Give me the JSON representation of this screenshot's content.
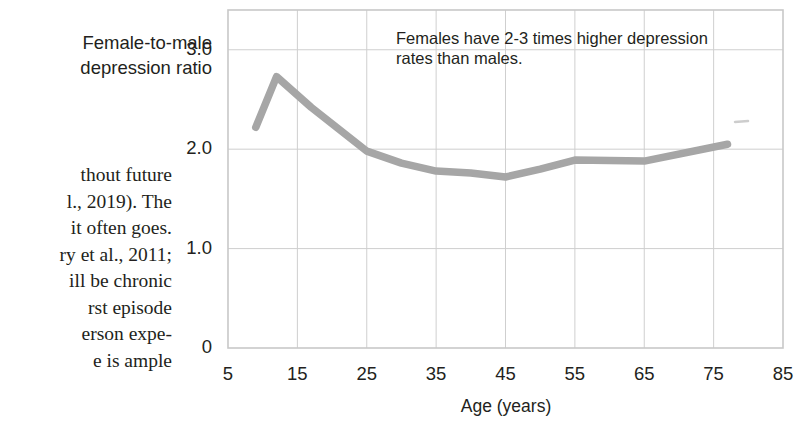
{
  "page": {
    "axis_title_lines": [
      "Female-to-male",
      "depression ratio"
    ],
    "body_text_lines": [
      "thout future",
      "l., 2019). The",
      "it often goes.",
      "ry et al., 2011;",
      "ill be chronic",
      "rst episode",
      "erson expe-",
      "e is ample"
    ]
  },
  "chart_data": {
    "type": "line",
    "title": "",
    "annotation": "Females have 2-3 times higher depression rates than males.",
    "annotation_lines": [
      "Females have 2-3 times higher depression",
      "rates than males."
    ],
    "xlabel": "Age (years)",
    "ylabel": "Female-to-male depression ratio",
    "xlim": [
      5,
      85
    ],
    "ylim": [
      0,
      3.4
    ],
    "xticks": [
      5,
      15,
      25,
      35,
      45,
      55,
      65,
      75,
      85
    ],
    "xtick_labels": [
      "5",
      "15",
      "25",
      "35",
      "45",
      "55",
      "65",
      "75",
      "85"
    ],
    "yticks": [
      0,
      1.0,
      2.0,
      3.0
    ],
    "ytick_labels": [
      "0",
      "1.0",
      "2.0",
      "3.0"
    ],
    "grid": true,
    "legend": "none",
    "line_color": "#a6a6a6",
    "grid_color": "#cfcfcf",
    "frame_color": "#c8c8c8",
    "text_color": "#231f20",
    "x": [
      9,
      12,
      17,
      25,
      30,
      35,
      40,
      45,
      50,
      55,
      65,
      77
    ],
    "values": [
      2.22,
      2.73,
      2.42,
      1.98,
      1.86,
      1.78,
      1.76,
      1.72,
      1.8,
      1.89,
      1.88,
      2.05
    ],
    "series": [
      {
        "name": "Female-to-male depression ratio",
        "points": [
          {
            "age": 9,
            "ratio": 2.22
          },
          {
            "age": 12,
            "ratio": 2.73
          },
          {
            "age": 17,
            "ratio": 2.42
          },
          {
            "age": 25,
            "ratio": 1.98
          },
          {
            "age": 30,
            "ratio": 1.86
          },
          {
            "age": 35,
            "ratio": 1.78
          },
          {
            "age": 40,
            "ratio": 1.76
          },
          {
            "age": 45,
            "ratio": 1.72
          },
          {
            "age": 50,
            "ratio": 1.8
          },
          {
            "age": 55,
            "ratio": 1.89
          },
          {
            "age": 65,
            "ratio": 1.88
          },
          {
            "age": 77,
            "ratio": 2.05
          }
        ]
      }
    ]
  }
}
